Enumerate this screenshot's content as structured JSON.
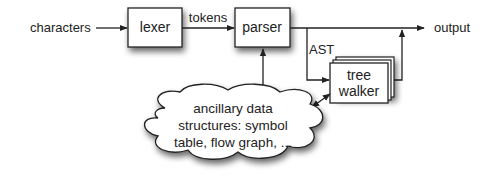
{
  "diagram": {
    "type": "flowchart",
    "nodes": {
      "input": {
        "label": "characters"
      },
      "lexer": {
        "label": "lexer"
      },
      "parser": {
        "label": "parser"
      },
      "tree_walker": {
        "label_line1": "tree",
        "label_line2": "walker"
      },
      "output": {
        "label": "output"
      },
      "ancillary": {
        "line1": "ancillary data",
        "line2": "structures: symbol",
        "line3": "table, flow graph, ..."
      }
    },
    "edges": {
      "tokens": {
        "label": "tokens",
        "from": "lexer",
        "to": "parser"
      },
      "ast": {
        "label": "AST",
        "from": "parser",
        "to": "tree_walker"
      }
    },
    "colors": {
      "stroke": "#222222",
      "fill": "#ffffff",
      "shadow": "#555555"
    }
  }
}
